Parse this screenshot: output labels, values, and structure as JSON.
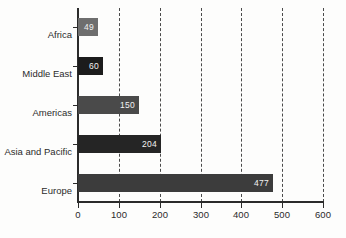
{
  "chart_data": {
    "type": "bar",
    "orientation": "horizontal",
    "title": "",
    "subtitle": "",
    "xlabel": "",
    "ylabel": "",
    "categories": [
      "Africa",
      "Middle East",
      "Americas",
      "Asia and Pacific",
      "Europe"
    ],
    "values": [
      49,
      60,
      150,
      204,
      477
    ],
    "value_labels": [
      "49",
      "60",
      "150",
      "204",
      "477"
    ],
    "bar_colors": [
      "#6e6e6e",
      "#1c1c1c",
      "#4a4a4a",
      "#252525",
      "#3c3c3c"
    ],
    "xlim": [
      0,
      600
    ],
    "xticks": [
      0,
      100,
      200,
      300,
      400,
      500,
      600
    ],
    "xtick_labels": [
      "0",
      "100",
      "200",
      "300",
      "400",
      "500",
      "600"
    ],
    "grid": "vertical-dashed",
    "legend": "none",
    "background_color": "#fdfdfc",
    "axis_color": "#2b2b2b",
    "value_label_color": "#f2f2f2",
    "tick_label_color": "#2b2b2b"
  }
}
